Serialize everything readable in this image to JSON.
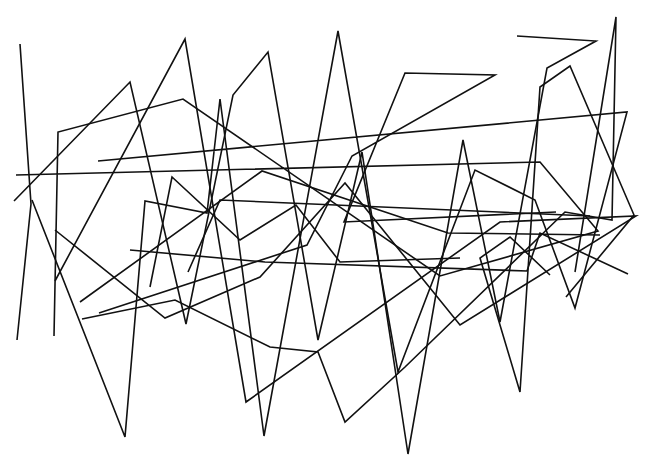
{
  "drawing": {
    "description": "Abstract continuous line drawing of zigzag segments",
    "stroke_color": "#111111",
    "background_color": "#ffffff",
    "stroke_width": 1.6,
    "segments": [
      [
        [
          20,
          44
        ],
        [
          31,
          204
        ],
        [
          17,
          340
        ]
      ],
      [
        [
          14,
          201
        ],
        [
          130,
          82
        ],
        [
          186,
          324
        ],
        [
          233,
          95
        ],
        [
          268,
          52
        ],
        [
          318,
          340
        ],
        [
          362,
          152
        ],
        [
          408,
          454
        ],
        [
          463,
          140
        ],
        [
          500,
          322
        ],
        [
          547,
          68
        ],
        [
          596,
          41
        ],
        [
          517,
          36
        ]
      ],
      [
        [
          16,
          175
        ],
        [
          540,
          162
        ],
        [
          598,
          231
        ],
        [
          440,
          276
        ],
        [
          183,
          99
        ],
        [
          58,
          132
        ],
        [
          54,
          336
        ]
      ],
      [
        [
          32,
          200
        ],
        [
          125,
          437
        ],
        [
          145,
          201
        ],
        [
          207,
          213
        ],
        [
          220,
          99
        ],
        [
          264,
          436
        ],
        [
          338,
          31
        ],
        [
          398,
          372
        ],
        [
          475,
          170
        ],
        [
          535,
          200
        ],
        [
          575,
          308
        ],
        [
          627,
          112
        ],
        [
          98,
          161
        ]
      ],
      [
        [
          55,
          230
        ],
        [
          165,
          318
        ],
        [
          260,
          277
        ],
        [
          345,
          183
        ],
        [
          460,
          325
        ],
        [
          636,
          216
        ],
        [
          500,
          222
        ],
        [
          246,
          402
        ],
        [
          185,
          39
        ],
        [
          55,
          281
        ]
      ],
      [
        [
          99,
          313
        ],
        [
          307,
          245
        ],
        [
          352,
          156
        ],
        [
          495,
          75
        ],
        [
          405,
          73
        ],
        [
          344,
          222
        ],
        [
          556,
          212
        ]
      ],
      [
        [
          188,
          272
        ],
        [
          220,
          200
        ],
        [
          590,
          216
        ]
      ],
      [
        [
          82,
          319
        ],
        [
          175,
          300
        ],
        [
          270,
          347
        ],
        [
          318,
          352
        ],
        [
          345,
          422
        ],
        [
          405,
          367
        ],
        [
          565,
          212
        ],
        [
          612,
          220
        ],
        [
          616,
          17
        ],
        [
          575,
          272
        ]
      ],
      [
        [
          130,
          250
        ],
        [
          265,
          262
        ],
        [
          527,
          271
        ],
        [
          540,
          233
        ],
        [
          628,
          274
        ]
      ],
      [
        [
          566,
          297
        ],
        [
          634,
          215
        ],
        [
          570,
          66
        ],
        [
          540,
          87
        ],
        [
          520,
          392
        ],
        [
          480,
          258
        ],
        [
          510,
          237
        ],
        [
          550,
          275
        ]
      ],
      [
        [
          150,
          287
        ],
        [
          172,
          177
        ],
        [
          240,
          240
        ],
        [
          296,
          205
        ],
        [
          340,
          262
        ],
        [
          460,
          258
        ]
      ],
      [
        [
          80,
          302
        ],
        [
          262,
          171
        ],
        [
          448,
          233
        ],
        [
          600,
          235
        ]
      ]
    ]
  }
}
